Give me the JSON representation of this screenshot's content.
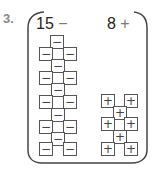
{
  "problem_number": "3.",
  "groups": [
    {
      "count": "15",
      "sign": "−",
      "label": "15 −"
    },
    {
      "count": "8",
      "sign": "+",
      "label": "8 +"
    }
  ],
  "tiles": {
    "negative": [
      {
        "x": 50,
        "y": 35
      },
      {
        "x": 39,
        "y": 47
      },
      {
        "x": 63,
        "y": 47
      },
      {
        "x": 51,
        "y": 59
      },
      {
        "x": 39,
        "y": 71
      },
      {
        "x": 63,
        "y": 71
      },
      {
        "x": 51,
        "y": 83
      },
      {
        "x": 39,
        "y": 95
      },
      {
        "x": 63,
        "y": 95
      },
      {
        "x": 51,
        "y": 108
      },
      {
        "x": 39,
        "y": 120
      },
      {
        "x": 63,
        "y": 120
      },
      {
        "x": 51,
        "y": 132
      },
      {
        "x": 39,
        "y": 142
      },
      {
        "x": 63,
        "y": 142
      }
    ],
    "positive": [
      {
        "x": 101,
        "y": 94
      },
      {
        "x": 124,
        "y": 94
      },
      {
        "x": 113,
        "y": 106
      },
      {
        "x": 101,
        "y": 117
      },
      {
        "x": 124,
        "y": 117
      },
      {
        "x": 113,
        "y": 130
      },
      {
        "x": 101,
        "y": 142
      },
      {
        "x": 124,
        "y": 142
      }
    ]
  },
  "colors": {
    "line": "#555555",
    "number": "#8a8a8a",
    "text": "#222222"
  }
}
